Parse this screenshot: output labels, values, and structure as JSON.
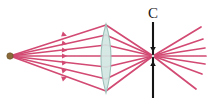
{
  "figure": {
    "background_color": "#ffffff",
    "width": 207,
    "height": 106
  },
  "labels": {
    "screen_label": "C"
  },
  "colors": {
    "ray": "#d24a73",
    "ray_light": "#e98aa8",
    "source_dot": "#8a6a3a",
    "source_dot_edge": "#6b5129",
    "lens_fill": "#d2e6e2",
    "lens_edge": "#9fbfb9",
    "screen_line": "#141414",
    "label_text": "#1a1a1a"
  },
  "chart_data": {
    "type": "scatter",
    "xlabel": "",
    "ylabel": "",
    "xlim": [
      0,
      207
    ],
    "ylim": [
      0,
      106
    ],
    "grid": false,
    "legend": "none",
    "optical_axis_y": 56,
    "elements": {
      "point_source": {
        "name": "point-source",
        "x": 10,
        "y": 56,
        "radius": 3.2,
        "color": "#8a6a3a"
      },
      "lens": {
        "name": "biconvex-converging-lens",
        "center_x": 106,
        "center_y": 58,
        "half_width": 10,
        "top_y": 24,
        "bottom_y": 93,
        "fill": "#d2e6e2",
        "edge": "#9fbfb9"
      },
      "screen": {
        "name": "screen-c",
        "x": 153,
        "top_y": 22,
        "bottom_y": 98,
        "color": "#141414",
        "label": "C",
        "label_x": 153,
        "label_y": 18,
        "arrow_top_tip_y": 52,
        "arrow_bottom_tip_y": 61
      },
      "focal_point": {
        "name": "image-convergence-point",
        "x": 153,
        "y": 56
      }
    },
    "incident_rays": [
      {
        "id": 1,
        "from": [
          10,
          56
        ],
        "to": [
          106,
          25
        ],
        "lens_y": 25
      },
      {
        "id": 2,
        "from": [
          10,
          56
        ],
        "to": [
          106,
          35
        ],
        "lens_y": 35
      },
      {
        "id": 3,
        "from": [
          10,
          56
        ],
        "to": [
          106,
          45
        ],
        "lens_y": 45
      },
      {
        "id": 4,
        "from": [
          10,
          56
        ],
        "to": [
          106,
          56
        ],
        "lens_y": 56
      },
      {
        "id": 5,
        "from": [
          10,
          56
        ],
        "to": [
          106,
          67
        ],
        "lens_y": 67
      },
      {
        "id": 6,
        "from": [
          10,
          56
        ],
        "to": [
          106,
          79
        ],
        "lens_y": 79
      },
      {
        "id": 7,
        "from": [
          10,
          56
        ],
        "to": [
          106,
          91
        ],
        "lens_y": 91
      }
    ],
    "refracted_rays": [
      {
        "id": 1,
        "from": [
          106,
          25
        ],
        "to": [
          153,
          56
        ]
      },
      {
        "id": 2,
        "from": [
          106,
          35
        ],
        "to": [
          153,
          56
        ]
      },
      {
        "id": 3,
        "from": [
          106,
          45
        ],
        "to": [
          153,
          56
        ]
      },
      {
        "id": 4,
        "from": [
          106,
          56
        ],
        "to": [
          153,
          56
        ]
      },
      {
        "id": 5,
        "from": [
          106,
          67
        ],
        "to": [
          153,
          56
        ]
      },
      {
        "id": 6,
        "from": [
          106,
          79
        ],
        "to": [
          153,
          56
        ]
      },
      {
        "id": 7,
        "from": [
          106,
          91
        ],
        "to": [
          153,
          56
        ]
      }
    ],
    "diverging_rays": [
      {
        "id": 1,
        "from": [
          153,
          56
        ],
        "to": [
          201,
          27
        ]
      },
      {
        "id": 2,
        "from": [
          153,
          56
        ],
        "to": [
          203,
          39
        ]
      },
      {
        "id": 3,
        "from": [
          153,
          56
        ],
        "to": [
          205,
          48
        ]
      },
      {
        "id": 4,
        "from": [
          153,
          56
        ],
        "to": [
          206,
          56
        ]
      },
      {
        "id": 5,
        "from": [
          153,
          56
        ],
        "to": [
          205,
          64
        ]
      },
      {
        "id": 6,
        "from": [
          153,
          56
        ],
        "to": [
          202,
          74
        ]
      },
      {
        "id": 7,
        "from": [
          153,
          56
        ],
        "to": [
          196,
          89
        ]
      }
    ],
    "ray_direction_arrows": [
      {
        "x": 62,
        "y": 34,
        "angle": 19
      },
      {
        "x": 62,
        "y": 43,
        "angle": 11
      },
      {
        "x": 62,
        "y": 50,
        "angle": 5
      },
      {
        "x": 62,
        "y": 56,
        "angle": 0
      },
      {
        "x": 62,
        "y": 63,
        "angle": -6
      },
      {
        "x": 62,
        "y": 71,
        "angle": -13
      },
      {
        "x": 62,
        "y": 79,
        "angle": -20
      }
    ]
  }
}
